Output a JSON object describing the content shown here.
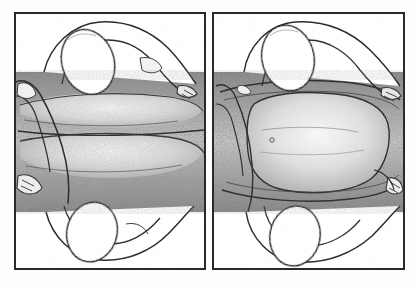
{
  "document": {
    "kind": "illustration-plate",
    "title": "",
    "caption": "",
    "has_text": false,
    "width": 416,
    "height": 288,
    "background_color": "#fefefe",
    "style": "pen-and-ink stipple / hatched grayscale anatomical line drawing",
    "panel_count": 2
  },
  "colors": {
    "page_background": "#fefefe",
    "panel_fill": "#ffffff",
    "panel_border": "#2a2a2a",
    "ink_line": "#2b2b2b",
    "ink_line_soft": "#555555",
    "stipple_dark": "#4a4a4a",
    "stipple_mid": "#7d7d7d",
    "stipple_light": "#b4b4b4",
    "tone_wash": "#9a9a9a"
  },
  "layout": {
    "panel_top": 12,
    "panel_bottom": 270,
    "panel_border_width": 2,
    "gutter_width": 6,
    "band_top": 72,
    "band_bottom": 212
  },
  "panels": [
    {
      "id": "panel-left",
      "label": "left-panel",
      "position": "left",
      "x": 14,
      "y": 12,
      "width": 192,
      "height": 258,
      "band": {
        "label": "central-stippled-band",
        "top": 72,
        "bottom": 212,
        "tone": "dark-stipple"
      },
      "forms": [
        {
          "name": "upper-oval-form",
          "kind": "oval-outline",
          "cx": 88,
          "cy": 62,
          "rx": 26,
          "ry": 33,
          "rotation": -18
        },
        {
          "name": "upper-limb-outline",
          "kind": "curved-limb",
          "side": "top"
        },
        {
          "name": "lower-oval-form",
          "kind": "oval-outline",
          "cx": 92,
          "cy": 232,
          "rx": 25,
          "ry": 30,
          "rotation": 14
        },
        {
          "name": "lower-limb-outline",
          "kind": "curved-limb",
          "side": "bottom"
        },
        {
          "name": "left-edge-limb-form",
          "kind": "curved-limb",
          "side": "left"
        },
        {
          "name": "central-elongated-mass-upper",
          "kind": "stippled-mass"
        },
        {
          "name": "central-elongated-mass-lower",
          "kind": "stippled-mass"
        }
      ]
    },
    {
      "id": "panel-right",
      "label": "right-panel",
      "position": "right",
      "x": 212,
      "y": 12,
      "width": 193,
      "height": 258,
      "band": {
        "label": "central-stippled-band",
        "top": 72,
        "bottom": 212,
        "tone": "dark-stipple"
      },
      "forms": [
        {
          "name": "upper-oval-form",
          "kind": "oval-outline",
          "cx": 288,
          "cy": 58,
          "rx": 26,
          "ry": 33,
          "rotation": -12
        },
        {
          "name": "upper-limb-outline",
          "kind": "curved-limb",
          "side": "top"
        },
        {
          "name": "lower-oval-form",
          "kind": "oval-outline",
          "cx": 295,
          "cy": 236,
          "rx": 25,
          "ry": 30,
          "rotation": 10
        },
        {
          "name": "lower-limb-outline",
          "kind": "curved-limb",
          "side": "bottom"
        },
        {
          "name": "right-edge-limb-form",
          "kind": "curved-limb",
          "side": "right"
        },
        {
          "name": "central-rounded-mass",
          "kind": "stippled-mass"
        },
        {
          "name": "upper-fold-line",
          "kind": "contour-line"
        },
        {
          "name": "lower-fold-line",
          "kind": "contour-line"
        }
      ]
    }
  ]
}
